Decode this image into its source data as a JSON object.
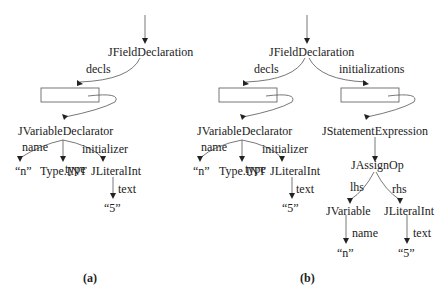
{
  "diagram_a": {
    "caption": "(a)",
    "root": "JFieldDeclaration",
    "edge_decls": "decls",
    "declarator": "JVariableDeclarator",
    "edge_name": "name",
    "edge_type": "type",
    "edge_initializer": "initializer",
    "name_value": "“n”",
    "type_value": "Type.INT",
    "literal": "JLiteralInt",
    "edge_text": "text",
    "literal_value": "“5”"
  },
  "diagram_b": {
    "caption": "(b)",
    "root": "JFieldDeclaration",
    "edge_decls": "decls",
    "edge_initializations": "initializations",
    "declarator": "JVariableDeclarator",
    "edge_name": "name",
    "edge_type": "type",
    "edge_initializer": "initializer",
    "name_value": "“n”",
    "type_value": "Type.INT",
    "literal": "JLiteralInt",
    "edge_text": "text",
    "literal_value": "“5”",
    "stmt": "JStatementExpression",
    "assign": "JAssignOp",
    "edge_lhs": "lhs",
    "edge_rhs": "rhs",
    "variable": "JVariable",
    "var_edge_name": "name",
    "var_value": "“n”",
    "rhs_literal": "JLiteralInt",
    "rhs_edge_text": "text",
    "rhs_value": "“5”"
  }
}
